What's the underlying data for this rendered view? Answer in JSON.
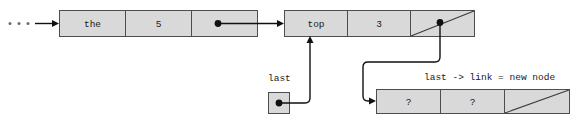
{
  "diagram": {
    "colors": {
      "cell_fill": "#d9d9d9",
      "cell_stroke": "#4d4d4d",
      "line": "#111111",
      "text": "#1a1a1a",
      "ellipsis": "#6e6e6e",
      "background": "#ffffff"
    },
    "nodes": [
      {
        "id": "node-the",
        "cells": [
          {
            "id": "node-the-data",
            "label": "the",
            "kind": "data"
          },
          {
            "id": "node-the-count",
            "label": "5",
            "kind": "data"
          },
          {
            "id": "node-the-link",
            "label": "",
            "kind": "pointer"
          }
        ]
      },
      {
        "id": "node-top",
        "cells": [
          {
            "id": "node-top-data",
            "label": "top",
            "kind": "data"
          },
          {
            "id": "node-top-count",
            "label": "3",
            "kind": "data"
          },
          {
            "id": "node-top-link",
            "label": "",
            "kind": "null-pointer"
          }
        ]
      },
      {
        "id": "node-new",
        "cells": [
          {
            "id": "node-new-data",
            "label": "?",
            "kind": "data"
          },
          {
            "id": "node-new-count",
            "label": "?",
            "kind": "data"
          },
          {
            "id": "node-new-link",
            "label": "",
            "kind": "null-pointer"
          }
        ]
      }
    ],
    "pointers": [
      {
        "id": "last-pointer",
        "label": "last",
        "kind": "variable-box"
      }
    ],
    "annotations": [
      {
        "id": "assignment-caption",
        "text": "last -> link = new node"
      }
    ],
    "ellipsis": {
      "id": "incoming-ellipsis",
      "text": "...",
      "dot_count": 3
    }
  }
}
